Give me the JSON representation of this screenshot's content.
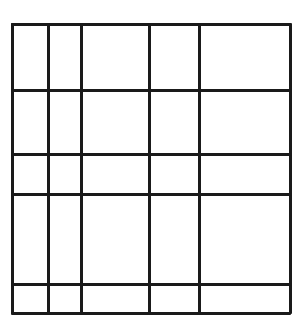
{
  "diagram": {
    "type": "grid",
    "line_color": "#1a1a1a",
    "background_color": "#ffffff",
    "line_width": 3,
    "bounds": {
      "left": 12,
      "top": 24,
      "right": 290,
      "bottom": 313
    },
    "vertical_lines_x": [
      12,
      48,
      81,
      149,
      199,
      290
    ],
    "horizontal_lines_y": [
      24,
      90,
      154,
      194,
      284,
      313
    ],
    "columns": 5,
    "rows": 5
  }
}
